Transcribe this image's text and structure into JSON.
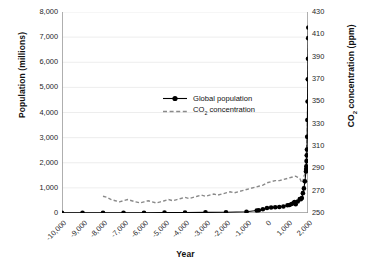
{
  "chart_data": {
    "type": "line",
    "title": "",
    "xlabel": "Year",
    "ylabel": "Population (millions)",
    "y2label": "CO2 concentration (ppm)",
    "xlim": [
      -10000,
      2000
    ],
    "ylim": [
      0,
      8000
    ],
    "y2lim": [
      250,
      430
    ],
    "grid": true,
    "legend_position": "center-right",
    "xticks": [
      "-10,000",
      "-9,000",
      "-8,000",
      "-7,000",
      "-6,000",
      "-5,000",
      "-4,000",
      "-3,000",
      "-2,000",
      "-1,000",
      "0",
      "1,000",
      "2,000"
    ],
    "xtick_values": [
      -10000,
      -9000,
      -8000,
      -7000,
      -6000,
      -5000,
      -4000,
      -3000,
      -2000,
      -1000,
      0,
      1000,
      2000
    ],
    "yticks": [
      "0",
      "1,000",
      "2,000",
      "3,000",
      "4,000",
      "5,000",
      "6,000",
      "7,000",
      "8,000"
    ],
    "ytick_values": [
      0,
      1000,
      2000,
      3000,
      4000,
      5000,
      6000,
      7000,
      8000
    ],
    "y2ticks": [
      "250",
      "270",
      "290",
      "310",
      "330",
      "350",
      "370",
      "390",
      "410",
      "430"
    ],
    "y2tick_values": [
      250,
      270,
      290,
      310,
      330,
      350,
      370,
      390,
      410,
      430
    ],
    "series": [
      {
        "name": "Global population",
        "axis": "left",
        "style": "solid-with-markers",
        "color": "#000000",
        "x": [
          -10000,
          -9000,
          -8000,
          -7000,
          -6000,
          -5000,
          -4000,
          -3000,
          -2000,
          -1000,
          -500,
          -400,
          -200,
          0,
          200,
          400,
          600,
          800,
          1000,
          1100,
          1200,
          1300,
          1340,
          1400,
          1500,
          1600,
          1650,
          1700,
          1750,
          1800,
          1850,
          1900,
          1910,
          1920,
          1930,
          1940,
          1950,
          1960,
          1970,
          1980,
          1990,
          2000,
          2010,
          2015
        ],
        "y": [
          4,
          5,
          5,
          7,
          10,
          15,
          20,
          25,
          30,
          50,
          100,
          110,
          150,
          200,
          220,
          230,
          240,
          260,
          310,
          320,
          360,
          400,
          440,
          350,
          460,
          560,
          550,
          600,
          790,
          980,
          1260,
          1650,
          1750,
          1860,
          2070,
          2300,
          2530,
          3030,
          3700,
          4440,
          5320,
          6140,
          6960,
          7380
        ]
      },
      {
        "name": "CO2 concentration",
        "axis": "right",
        "style": "dashed",
        "color": "#8a8a8a",
        "x": [
          -8000,
          -7800,
          -7600,
          -7400,
          -7200,
          -7000,
          -6800,
          -6600,
          -6400,
          -6200,
          -6000,
          -5800,
          -5600,
          -5400,
          -5200,
          -5000,
          -4800,
          -4600,
          -4400,
          -4200,
          -4000,
          -3800,
          -3600,
          -3400,
          -3200,
          -3000,
          -2800,
          -2600,
          -2400,
          -2200,
          -2000,
          -1800,
          -1600,
          -1400,
          -1200,
          -1000,
          -800,
          -600,
          -400,
          -200,
          0,
          200,
          400,
          600,
          800,
          1000,
          1200,
          1400,
          1500,
          1600,
          1700,
          1750,
          1800,
          1850,
          1880,
          1900,
          1920,
          1940,
          1950,
          1960,
          1970,
          1980,
          1990,
          2000,
          2010,
          2015
        ],
        "y": [
          265,
          264,
          262,
          261,
          260,
          261,
          262,
          261,
          260,
          259,
          260,
          261,
          260,
          259,
          260,
          261,
          262,
          261,
          262,
          263,
          264,
          263,
          264,
          265,
          266,
          265,
          266,
          267,
          266,
          267,
          268,
          269,
          268,
          269,
          270,
          271,
          272,
          273,
          274,
          275,
          277,
          278,
          279,
          279,
          280,
          281,
          282,
          283,
          282,
          281,
          277,
          278,
          283,
          285,
          291,
          296,
          303,
          311,
          311,
          317,
          325,
          339,
          354,
          369,
          389,
          400
        ]
      }
    ]
  },
  "legend": {
    "items": [
      {
        "label": "Global population",
        "marker": "solid-line-dot"
      },
      {
        "label": "CO2 concentration",
        "marker": "dashed-line",
        "label_pre": "CO",
        "label_sub": "2",
        "label_post": " concentration"
      }
    ]
  },
  "axes": {
    "left_title": "Population (millions)",
    "right_title_pre": "CO",
    "right_title_sub": "2",
    "right_title_post": " concentration (ppm)",
    "bottom_title": "Year"
  },
  "colors": {
    "population_line": "#000000",
    "co2_line": "#8a8a8a",
    "grid": "#e8e8e8",
    "axis": "#555555",
    "text": "#1a1a1a"
  }
}
